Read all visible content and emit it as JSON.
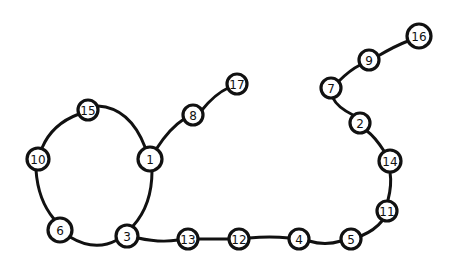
{
  "diagram": {
    "type": "graph",
    "style": "hand-drawn",
    "colors": {
      "stroke": "#111111",
      "background": "#ffffff",
      "node_fill": "#ffffff"
    },
    "nodes": [
      {
        "id": "15",
        "label": "15",
        "x": 88,
        "y": 110,
        "r": 10
      },
      {
        "id": "10",
        "label": "10",
        "x": 38,
        "y": 159,
        "r": 11
      },
      {
        "id": "1",
        "label": "1",
        "x": 150,
        "y": 159,
        "r": 12
      },
      {
        "id": "6",
        "label": "6",
        "x": 60,
        "y": 230,
        "r": 12
      },
      {
        "id": "3",
        "label": "3",
        "x": 127,
        "y": 236,
        "r": 11
      },
      {
        "id": "8",
        "label": "8",
        "x": 193,
        "y": 115,
        "r": 10
      },
      {
        "id": "17",
        "label": "17",
        "x": 237,
        "y": 84,
        "r": 10
      },
      {
        "id": "13",
        "label": "13",
        "x": 188,
        "y": 239,
        "r": 10
      },
      {
        "id": "12",
        "label": "12",
        "x": 239,
        "y": 239,
        "r": 10
      },
      {
        "id": "4",
        "label": "4",
        "x": 299,
        "y": 239,
        "r": 10
      },
      {
        "id": "5",
        "label": "5",
        "x": 351,
        "y": 239,
        "r": 10
      },
      {
        "id": "11",
        "label": "11",
        "x": 387,
        "y": 211,
        "r": 10
      },
      {
        "id": "14",
        "label": "14",
        "x": 390,
        "y": 161,
        "r": 11
      },
      {
        "id": "2",
        "label": "2",
        "x": 360,
        "y": 123,
        "r": 10
      },
      {
        "id": "7",
        "label": "7",
        "x": 331,
        "y": 88,
        "r": 10
      },
      {
        "id": "9",
        "label": "9",
        "x": 369,
        "y": 60,
        "r": 10
      },
      {
        "id": "16",
        "label": "16",
        "x": 419,
        "y": 36,
        "r": 12
      }
    ],
    "edges": [
      {
        "from": "15",
        "to": "1",
        "path": "M98,106 Q130,108 145,147"
      },
      {
        "from": "15",
        "to": "10",
        "path": "M79,114 Q52,124 42,148"
      },
      {
        "from": "10",
        "to": "6",
        "path": "M36,170 Q38,200 54,219"
      },
      {
        "from": "6",
        "to": "3",
        "path": "M70,237 Q95,252 117,240"
      },
      {
        "from": "3",
        "to": "1",
        "path": "M133,226 Q152,205 152,171"
      },
      {
        "from": "1",
        "to": "8",
        "path": "M157,148 Q170,128 184,119"
      },
      {
        "from": "8",
        "to": "17",
        "path": "M202,110 Q215,94 228,88"
      },
      {
        "from": "3",
        "to": "13",
        "path": "M138,238 Q160,243 178,240"
      },
      {
        "from": "13",
        "to": "12",
        "path": "M198,239 L229,239"
      },
      {
        "from": "12",
        "to": "4",
        "path": "M249,238 Q270,236 289,238"
      },
      {
        "from": "4",
        "to": "5",
        "path": "M309,241 Q325,246 341,241"
      },
      {
        "from": "5",
        "to": "11",
        "path": "M361,236 Q375,230 382,221"
      },
      {
        "from": "11",
        "to": "14",
        "path": "M388,200 Q392,185 390,172"
      },
      {
        "from": "14",
        "to": "2",
        "path": "M384,151 Q375,137 367,131"
      },
      {
        "from": "2",
        "to": "7",
        "path": "M353,115 Q337,107 333,98"
      },
      {
        "from": "7",
        "to": "9",
        "path": "M339,81 Q350,70 360,65"
      },
      {
        "from": "9",
        "to": "16",
        "path": "M378,56 Q395,46 408,41"
      }
    ]
  }
}
